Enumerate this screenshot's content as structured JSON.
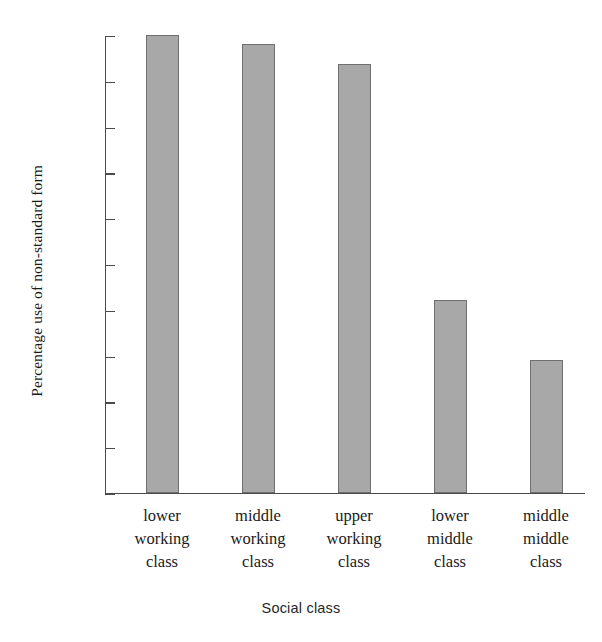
{
  "chart_data": {
    "type": "bar",
    "title": "",
    "xlabel": "Social class",
    "ylabel": "Percentage use of non-standard form",
    "categories": [
      "lower working class",
      "middle working class",
      "upper working class",
      "lower middle class",
      "middle middle class"
    ],
    "category_lines": [
      [
        "lower",
        "working",
        "class"
      ],
      [
        "middle",
        "working",
        "class"
      ],
      [
        "upper",
        "working",
        "class"
      ],
      [
        "lower",
        "middle",
        "class"
      ],
      [
        "middle",
        "middle",
        "class"
      ]
    ],
    "values": [
      100,
      98,
      93.5,
      42,
      29
    ],
    "ylim": [
      0,
      100
    ],
    "ytick_labels": [
      "100",
      "90",
      "80",
      "70",
      "60",
      "50",
      "40",
      "30",
      "20",
      "10",
      "0"
    ],
    "ytick_values": [
      100,
      90,
      80,
      70,
      60,
      50,
      40,
      30,
      20,
      10,
      0
    ],
    "grid": false,
    "legend": "none",
    "colors": {
      "bar_fill": "#a8a8a8",
      "bar_edge": "#6f6f6f",
      "axis": "#4a4a4a",
      "text": "#1a1a1a",
      "background": "#ffffff"
    }
  }
}
